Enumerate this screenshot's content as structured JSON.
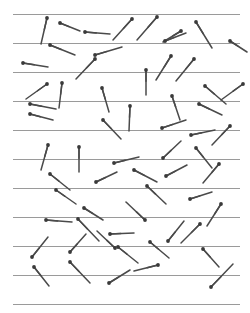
{
  "figure": {
    "width": 250,
    "height": 313,
    "background_color": "#ffffff"
  },
  "ruled_lines": {
    "label": "parallel ruled lines",
    "count": 11,
    "color": "#9a9a9a",
    "stroke_width": 1,
    "x_start": 13,
    "x_end": 240,
    "spacing": 29,
    "y_values": [
      14,
      43,
      72,
      101,
      130,
      159,
      188,
      217,
      246,
      275,
      304
    ]
  },
  "needles": {
    "label": "scattered needles",
    "count": 60,
    "shaft_color": "#4a4a4a",
    "head_color": "#3a3a3a",
    "head_radius": 1.9,
    "stroke_width": 1.5,
    "items": [
      {
        "x1": 47,
        "y1": 18,
        "x2": 41,
        "y2": 44
      },
      {
        "x1": 60,
        "y1": 23,
        "x2": 80,
        "y2": 31
      },
      {
        "x1": 85,
        "y1": 32,
        "x2": 110,
        "y2": 34
      },
      {
        "x1": 132,
        "y1": 19,
        "x2": 113,
        "y2": 40
      },
      {
        "x1": 157,
        "y1": 17,
        "x2": 137,
        "y2": 40
      },
      {
        "x1": 196,
        "y1": 22,
        "x2": 212,
        "y2": 48
      },
      {
        "x1": 181,
        "y1": 31,
        "x2": 163,
        "y2": 42
      },
      {
        "x1": 50,
        "y1": 45,
        "x2": 75,
        "y2": 55
      },
      {
        "x1": 95,
        "y1": 55,
        "x2": 122,
        "y2": 47
      },
      {
        "x1": 165,
        "y1": 41,
        "x2": 186,
        "y2": 33
      },
      {
        "x1": 230,
        "y1": 41,
        "x2": 247,
        "y2": 52
      },
      {
        "x1": 23,
        "y1": 63,
        "x2": 48,
        "y2": 67
      },
      {
        "x1": 95,
        "y1": 59,
        "x2": 76,
        "y2": 79
      },
      {
        "x1": 171,
        "y1": 56,
        "x2": 156,
        "y2": 80
      },
      {
        "x1": 194,
        "y1": 59,
        "x2": 176,
        "y2": 81
      },
      {
        "x1": 146,
        "y1": 70,
        "x2": 146,
        "y2": 95
      },
      {
        "x1": 47,
        "y1": 84,
        "x2": 26,
        "y2": 99
      },
      {
        "x1": 62,
        "y1": 83,
        "x2": 59,
        "y2": 108
      },
      {
        "x1": 30,
        "y1": 104,
        "x2": 56,
        "y2": 109
      },
      {
        "x1": 102,
        "y1": 88,
        "x2": 109,
        "y2": 112
      },
      {
        "x1": 205,
        "y1": 86,
        "x2": 226,
        "y2": 104
      },
      {
        "x1": 243,
        "y1": 84,
        "x2": 221,
        "y2": 100
      },
      {
        "x1": 172,
        "y1": 96,
        "x2": 180,
        "y2": 120
      },
      {
        "x1": 199,
        "y1": 104,
        "x2": 222,
        "y2": 115
      },
      {
        "x1": 30,
        "y1": 114,
        "x2": 53,
        "y2": 120
      },
      {
        "x1": 130,
        "y1": 106,
        "x2": 129,
        "y2": 131
      },
      {
        "x1": 103,
        "y1": 120,
        "x2": 121,
        "y2": 139
      },
      {
        "x1": 162,
        "y1": 128,
        "x2": 186,
        "y2": 120
      },
      {
        "x1": 191,
        "y1": 135,
        "x2": 215,
        "y2": 130
      },
      {
        "x1": 230,
        "y1": 126,
        "x2": 212,
        "y2": 145
      },
      {
        "x1": 48,
        "y1": 145,
        "x2": 41,
        "y2": 170
      },
      {
        "x1": 79,
        "y1": 147,
        "x2": 79,
        "y2": 172
      },
      {
        "x1": 114,
        "y1": 163,
        "x2": 139,
        "y2": 157
      },
      {
        "x1": 163,
        "y1": 158,
        "x2": 181,
        "y2": 141
      },
      {
        "x1": 196,
        "y1": 148,
        "x2": 212,
        "y2": 168
      },
      {
        "x1": 50,
        "y1": 174,
        "x2": 70,
        "y2": 190
      },
      {
        "x1": 96,
        "y1": 182,
        "x2": 117,
        "y2": 172
      },
      {
        "x1": 134,
        "y1": 170,
        "x2": 157,
        "y2": 182
      },
      {
        "x1": 166,
        "y1": 176,
        "x2": 187,
        "y2": 165
      },
      {
        "x1": 219,
        "y1": 164,
        "x2": 203,
        "y2": 183
      },
      {
        "x1": 56,
        "y1": 190,
        "x2": 76,
        "y2": 204
      },
      {
        "x1": 147,
        "y1": 186,
        "x2": 166,
        "y2": 204
      },
      {
        "x1": 190,
        "y1": 199,
        "x2": 212,
        "y2": 192
      },
      {
        "x1": 84,
        "y1": 208,
        "x2": 103,
        "y2": 220
      },
      {
        "x1": 145,
        "y1": 220,
        "x2": 126,
        "y2": 202
      },
      {
        "x1": 221,
        "y1": 204,
        "x2": 207,
        "y2": 226
      },
      {
        "x1": 46,
        "y1": 220,
        "x2": 72,
        "y2": 222
      },
      {
        "x1": 78,
        "y1": 219,
        "x2": 99,
        "y2": 241
      },
      {
        "x1": 110,
        "y1": 234,
        "x2": 134,
        "y2": 233
      },
      {
        "x1": 168,
        "y1": 241,
        "x2": 184,
        "y2": 221
      },
      {
        "x1": 200,
        "y1": 224,
        "x2": 181,
        "y2": 243
      },
      {
        "x1": 32,
        "y1": 257,
        "x2": 48,
        "y2": 237
      },
      {
        "x1": 70,
        "y1": 252,
        "x2": 86,
        "y2": 234
      },
      {
        "x1": 115,
        "y1": 248,
        "x2": 97,
        "y2": 231
      },
      {
        "x1": 118,
        "y1": 247,
        "x2": 138,
        "y2": 263
      },
      {
        "x1": 150,
        "y1": 242,
        "x2": 169,
        "y2": 258
      },
      {
        "x1": 203,
        "y1": 249,
        "x2": 219,
        "y2": 267
      },
      {
        "x1": 34,
        "y1": 267,
        "x2": 49,
        "y2": 286
      },
      {
        "x1": 70,
        "y1": 262,
        "x2": 90,
        "y2": 283
      },
      {
        "x1": 109,
        "y1": 283,
        "x2": 130,
        "y2": 270
      },
      {
        "x1": 158,
        "y1": 265,
        "x2": 134,
        "y2": 271
      },
      {
        "x1": 211,
        "y1": 287,
        "x2": 233,
        "y2": 264
      }
    ]
  }
}
